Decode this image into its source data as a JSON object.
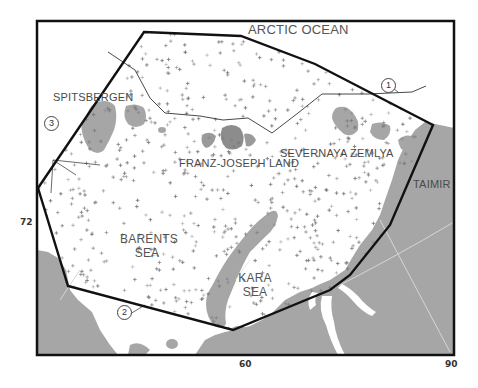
{
  "map": {
    "labels": {
      "arctic_ocean": "ARCTIC OCEAN",
      "spitsbergen": "SPITSBERGEN",
      "franz_joseph_land": "FRANZ-JOSEPH LAND",
      "severnaya_zemlya": "SEVERNAYA ZEMLYA",
      "taimir": "TAIMIR",
      "barents_sea_1": "BARENTS",
      "barents_sea_2": "SEA",
      "kara_sea_1": "KARA",
      "kara_sea_2": "SEA"
    },
    "markers": {
      "m1": "1",
      "m2": "2",
      "m3": "3"
    },
    "axis": {
      "lat_72": "72",
      "lon_60": "60",
      "lon_90": "90"
    },
    "colors": {
      "land": "#a6a6a6",
      "land_dark": "#8c8c8c",
      "water": "#ffffff",
      "frame": "#111111",
      "points": "#7a7a7a"
    }
  }
}
